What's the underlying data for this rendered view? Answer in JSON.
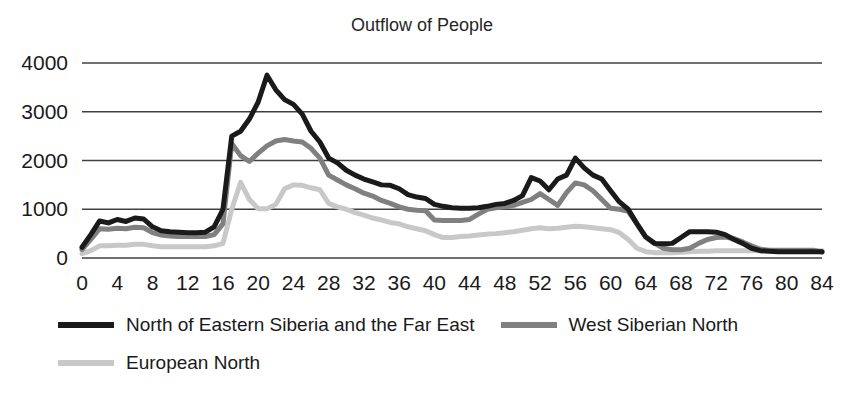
{
  "chart_data": {
    "type": "line",
    "title": "Outflow of People",
    "xlabel": "",
    "ylabel": "",
    "xlim": [
      0,
      84
    ],
    "ylim": [
      0,
      4000
    ],
    "grid": true,
    "grid_axis": "y",
    "legend_position": "bottom-left",
    "yticks": [
      0,
      1000,
      2000,
      3000,
      4000
    ],
    "ytick_labels": [
      "0",
      "1000",
      "2000",
      "3000",
      "4000"
    ],
    "xticks": [
      0,
      4,
      8,
      12,
      16,
      20,
      24,
      28,
      32,
      36,
      40,
      44,
      48,
      52,
      56,
      60,
      64,
      68,
      72,
      76,
      80,
      84
    ],
    "xtick_labels": [
      "0",
      "4",
      "8",
      "12",
      "16",
      "20",
      "24",
      "28",
      "32",
      "36",
      "40",
      "44",
      "48",
      "52",
      "56",
      "60",
      "64",
      "68",
      "72",
      "76",
      "80",
      "84"
    ],
    "x": [
      0,
      1,
      2,
      3,
      4,
      5,
      6,
      7,
      8,
      9,
      10,
      11,
      12,
      13,
      14,
      15,
      16,
      17,
      18,
      19,
      20,
      21,
      22,
      23,
      24,
      25,
      26,
      27,
      28,
      29,
      30,
      31,
      32,
      33,
      34,
      35,
      36,
      37,
      38,
      39,
      40,
      41,
      42,
      43,
      44,
      45,
      46,
      47,
      48,
      49,
      50,
      51,
      52,
      53,
      54,
      55,
      56,
      57,
      58,
      59,
      60,
      61,
      62,
      63,
      64,
      65,
      66,
      67,
      68,
      69,
      70,
      71,
      72,
      73,
      74,
      75,
      76,
      77,
      78,
      79,
      80,
      81,
      82,
      83,
      84
    ],
    "series": [
      {
        "name": "North of Eastern Siberia and the Far East",
        "color": "#1a1a1a",
        "width": 5,
        "values": [
          220,
          480,
          760,
          720,
          790,
          750,
          820,
          800,
          640,
          560,
          540,
          530,
          520,
          520,
          530,
          640,
          1000,
          2500,
          2600,
          2850,
          3200,
          3750,
          3450,
          3250,
          3150,
          2950,
          2600,
          2380,
          2050,
          1950,
          1800,
          1700,
          1620,
          1560,
          1500,
          1490,
          1420,
          1300,
          1250,
          1220,
          1100,
          1060,
          1030,
          1020,
          1020,
          1030,
          1060,
          1100,
          1120,
          1180,
          1280,
          1650,
          1580,
          1400,
          1620,
          1700,
          2050,
          1850,
          1700,
          1620,
          1380,
          1150,
          1000,
          700,
          430,
          300,
          290,
          300,
          420,
          540,
          540,
          540,
          530,
          480,
          380,
          300,
          200,
          150,
          140,
          130,
          130,
          130,
          130,
          130,
          130
        ]
      },
      {
        "name": "West Siberian North",
        "color": "#808080",
        "width": 5,
        "values": [
          170,
          380,
          600,
          590,
          610,
          600,
          630,
          620,
          520,
          470,
          450,
          440,
          440,
          440,
          440,
          480,
          700,
          2350,
          2100,
          1980,
          2150,
          2300,
          2400,
          2430,
          2400,
          2380,
          2250,
          2050,
          1700,
          1600,
          1500,
          1420,
          1330,
          1270,
          1180,
          1120,
          1050,
          1000,
          980,
          970,
          780,
          770,
          770,
          770,
          790,
          900,
          1000,
          1030,
          1050,
          1080,
          1140,
          1200,
          1320,
          1200,
          1080,
          1340,
          1540,
          1500,
          1380,
          1200,
          1020,
          1000,
          960,
          700,
          430,
          300,
          200,
          170,
          170,
          200,
          300,
          380,
          420,
          430,
          400,
          330,
          250,
          180,
          160,
          160,
          160,
          160,
          160,
          160,
          120
        ]
      },
      {
        "name": "European North",
        "color": "#c8c8c8",
        "width": 5,
        "values": [
          90,
          150,
          250,
          250,
          260,
          260,
          280,
          280,
          250,
          230,
          230,
          230,
          230,
          230,
          230,
          250,
          300,
          1000,
          1550,
          1200,
          1010,
          1010,
          1100,
          1420,
          1500,
          1490,
          1440,
          1400,
          1120,
          1050,
          1000,
          930,
          880,
          820,
          780,
          730,
          700,
          640,
          600,
          560,
          480,
          420,
          420,
          440,
          450,
          470,
          490,
          500,
          520,
          540,
          570,
          600,
          620,
          600,
          610,
          630,
          650,
          640,
          620,
          600,
          580,
          520,
          380,
          200,
          130,
          110,
          110,
          110,
          120,
          130,
          140,
          140,
          150,
          150,
          150,
          150,
          150,
          150,
          150,
          150,
          150,
          150,
          150,
          150,
          150
        ]
      }
    ]
  },
  "legend": {
    "rows": [
      [
        {
          "label": "North of Eastern Siberia and the Far East",
          "color": "#1a1a1a",
          "width": 6,
          "name": "legend-item-north-of-eastern-siberia-and-the-far-east"
        },
        {
          "label": "West Siberian North",
          "color": "#808080",
          "width": 6,
          "name": "legend-item-west-siberian-north"
        }
      ],
      [
        {
          "label": "European North",
          "color": "#c8c8c8",
          "width": 6,
          "name": "legend-item-european-north"
        }
      ]
    ]
  },
  "axes": {
    "grid_color": "#404040",
    "axis_color": "#404040"
  }
}
